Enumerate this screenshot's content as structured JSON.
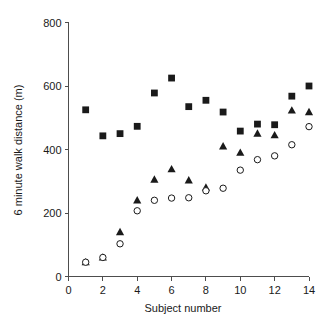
{
  "chart_data": {
    "type": "scatter",
    "title": "",
    "xlabel": "Subject number",
    "ylabel": "6 minute walk distance (m)",
    "xlim": [
      0,
      14
    ],
    "ylim": [
      0,
      800
    ],
    "xticks": [
      0,
      2,
      4,
      6,
      8,
      10,
      12,
      14
    ],
    "xticklabels": [
      "0",
      "2",
      "4",
      "6",
      "8",
      "10",
      "12",
      "14"
    ],
    "yticks": [
      0,
      200,
      400,
      600,
      800
    ],
    "yticklabels": [
      "0",
      "200",
      "400",
      "600",
      "800"
    ],
    "grid": false,
    "legend": "none",
    "x": [
      1,
      2,
      3,
      4,
      5,
      6,
      7,
      8,
      9,
      10,
      11,
      12,
      13,
      14
    ],
    "series": [
      {
        "name": "filled-square",
        "marker": "square",
        "fill": "#1a1a1a",
        "values": [
          525,
          443,
          450,
          473,
          578,
          625,
          535,
          555,
          518,
          458,
          480,
          478,
          568,
          600
        ]
      },
      {
        "name": "filled-triangle",
        "marker": "triangle",
        "fill": "#1a1a1a",
        "values": [
          45,
          60,
          140,
          240,
          305,
          338,
          303,
          280,
          410,
          390,
          450,
          445,
          523,
          518
        ]
      },
      {
        "name": "open-circle",
        "marker": "circle",
        "fill": "#ffffff",
        "values": [
          45,
          60,
          103,
          207,
          240,
          247,
          248,
          270,
          278,
          335,
          368,
          380,
          415,
          472
        ]
      }
    ]
  },
  "axes": {
    "x_title": "Subject number",
    "y_title": "6 minute walk distance (m)"
  },
  "colors": {
    "marker": "#1a1a1a",
    "axis": "#4d4d4d",
    "background": "#ffffff"
  }
}
